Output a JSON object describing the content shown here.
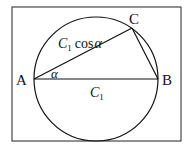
{
  "diagram": {
    "type": "geometry",
    "points": {
      "A": {
        "label": "A"
      },
      "B": {
        "label": "B"
      },
      "C": {
        "label": "C"
      }
    },
    "labels": {
      "hypotenuse_base": "C",
      "hypotenuse_sub": "1",
      "side_ac_base": "C",
      "side_ac_sub": "1",
      "side_ac_func": "cos",
      "side_ac_angle": "α",
      "angle_a": "α"
    },
    "colors": {
      "stroke": "#111111",
      "background": "#ffffff"
    }
  }
}
